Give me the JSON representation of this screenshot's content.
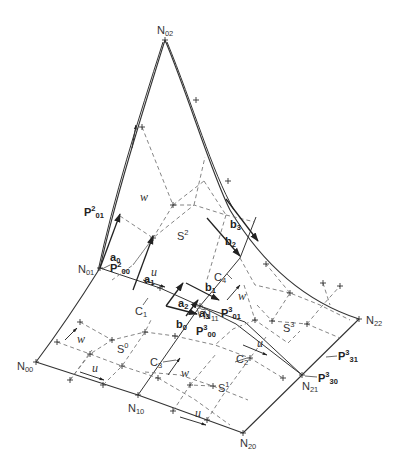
{
  "figure": {
    "nodes": {
      "N00": {
        "base": "N",
        "sub": "00"
      },
      "N01": {
        "base": "N",
        "sub": "01"
      },
      "N02": {
        "base": "N",
        "sub": "02"
      },
      "N10": {
        "base": "N",
        "sub": "10"
      },
      "N11": {
        "base": "N",
        "sub": "11"
      },
      "N20": {
        "base": "N",
        "sub": "20"
      },
      "N21": {
        "base": "N",
        "sub": "21"
      },
      "N22": {
        "base": "N",
        "sub": "22"
      }
    },
    "patches": {
      "S0": {
        "base": "S",
        "sup": "0"
      },
      "S1": {
        "base": "S",
        "sup": "1"
      },
      "S2": {
        "base": "S",
        "sup": "2"
      },
      "S3": {
        "base": "S",
        "sup": "3"
      }
    },
    "control_points": {
      "P2_01": {
        "base": "P",
        "sup": "2",
        "sub": "01"
      },
      "P2_00": {
        "base": "P",
        "sup": "2",
        "sub": "00"
      },
      "P3_01": {
        "base": "P",
        "sup": "3",
        "sub": "01"
      },
      "P3_00": {
        "base": "P",
        "sup": "3",
        "sub": "00"
      },
      "P3_31": {
        "base": "P",
        "sup": "3",
        "sub": "31"
      },
      "P3_30": {
        "base": "P",
        "sup": "3",
        "sub": "30"
      }
    },
    "vectors": {
      "a0": {
        "base": "a",
        "sub": "0"
      },
      "a1": {
        "base": "a",
        "sub": "1"
      },
      "a2": {
        "base": "a",
        "sub": "2"
      },
      "a3": {
        "base": "a",
        "sub": "3"
      },
      "b0": {
        "base": "b",
        "sub": "0"
      },
      "b1": {
        "base": "b",
        "sub": "1"
      },
      "b2": {
        "base": "b",
        "sub": "2"
      },
      "b3": {
        "base": "b",
        "sub": "3"
      }
    },
    "curves": {
      "C1": {
        "base": "C",
        "sub": "1"
      },
      "C2": {
        "base": "C",
        "sub": "2"
      },
      "C3": {
        "base": "C",
        "sub": "3"
      },
      "C4": {
        "base": "C",
        "sub": "4"
      }
    },
    "directions": {
      "u": "u",
      "w": "w"
    }
  }
}
